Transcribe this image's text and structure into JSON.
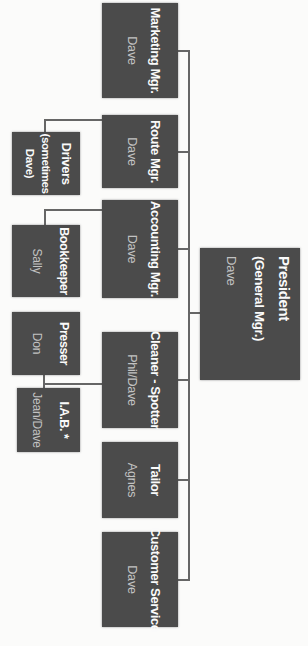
{
  "org_chart": {
    "root": {
      "title": "President",
      "subtitle": "(General Mgr.)",
      "name": "Dave"
    },
    "managers": [
      {
        "title": "Marketing Mgr.",
        "name": "Dave"
      },
      {
        "title": "Route Mgr.",
        "name": "Dave"
      },
      {
        "title": "Accounting Mgr.",
        "name": "Dave"
      },
      {
        "title": "Cleaner - Spotter",
        "name": "Phil/Dave"
      },
      {
        "title": "Tailor",
        "name": "Agnes"
      },
      {
        "title": "Customer Service",
        "name": "Dave"
      }
    ],
    "staff": [
      {
        "title": "Drivers",
        "note_line1": "(sometimes",
        "note_line2": "Dave)",
        "reports_to": "Route Mgr."
      },
      {
        "title": "Bookkeeper",
        "name": "Sally",
        "reports_to": "Accounting Mgr."
      },
      {
        "title": "Presser",
        "name": "Don",
        "reports_to": "Cleaner - Spotter"
      },
      {
        "title": "I.A.B. *",
        "name": "Jean/Dave",
        "reports_to": "Cleaner - Spotter"
      }
    ],
    "colors": {
      "box_fill": "#4b4b4b",
      "title_text": "#fafafa",
      "name_text": "#c2c2c2",
      "connector": "#666666",
      "background": "#fbfbfa"
    }
  }
}
